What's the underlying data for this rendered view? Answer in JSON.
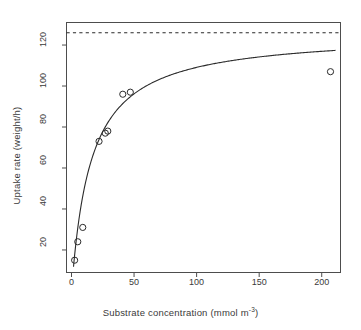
{
  "chart_data": {
    "type": "scatter",
    "title": "",
    "xlabel": "Substrate concentration (mmol m",
    "xlabel_sup": "-3",
    "xlabel_tail": ")",
    "ylabel": "Uptake rate (weight/h)",
    "xlim": [
      -4,
      215
    ],
    "ylim": [
      9,
      131
    ],
    "grid": false,
    "legend": null,
    "x_ticks": [
      0,
      50,
      100,
      150,
      200
    ],
    "y_ticks": [
      20,
      40,
      60,
      80,
      100,
      120
    ],
    "x_tick_labels": [
      "0",
      "50",
      "100",
      "150",
      "200"
    ],
    "y_tick_labels": [
      "20",
      "40",
      "60",
      "80",
      "100",
      "120"
    ],
    "points_label": "observed uptake",
    "x": [
      2.5,
      5,
      9,
      22,
      27,
      29,
      41,
      47,
      207
    ],
    "y": [
      15,
      24,
      31,
      73,
      77,
      78,
      96,
      97,
      107
    ],
    "series": [
      {
        "name": "observed uptake",
        "marker": "open-circle",
        "x": [
          2.5,
          5,
          9,
          22,
          27,
          29,
          41,
          47,
          207
        ],
        "y": [
          15,
          24,
          31,
          73,
          77,
          78,
          96,
          97,
          107
        ]
      }
    ],
    "fit_curve": {
      "name": "Michaelis-Menten fit",
      "style": "solid",
      "vmax": 126,
      "km": 15.5,
      "color": "#2b2b2b"
    },
    "asymptote": {
      "name": "Vmax asymptote",
      "style": "dashed",
      "value": 126,
      "color": "#2b2b2b"
    }
  }
}
